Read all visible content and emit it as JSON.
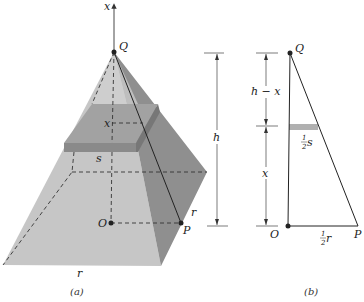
{
  "figure_a": {
    "caption": "(a)",
    "axis_label": "x",
    "apex_label": "Q",
    "center_label": "O",
    "corner_label": "P",
    "section_height_label": "x",
    "section_side_label": "s",
    "base_side_label": "r",
    "half_diagonal_label": "r",
    "height_label": "h"
  },
  "figure_b": {
    "caption": "(b)",
    "apex_label": "Q",
    "center_label": "O",
    "corner_label": "P",
    "upper_dim_label": "h − x",
    "lower_dim_label": "x",
    "section_half_num": "1",
    "section_half_den": "2",
    "section_half_var": "s",
    "base_half_num": "1",
    "base_half_den": "2",
    "base_half_var": "r"
  },
  "colors": {
    "left_face": "#c4c4c4",
    "right_face": "#8e8e8e",
    "slab_top": "#a4a4a4",
    "slab_front": "#8a8a8a",
    "slab_side": "#7a7a7a",
    "section_bar": "#b0b0b0",
    "line": "#333333"
  }
}
